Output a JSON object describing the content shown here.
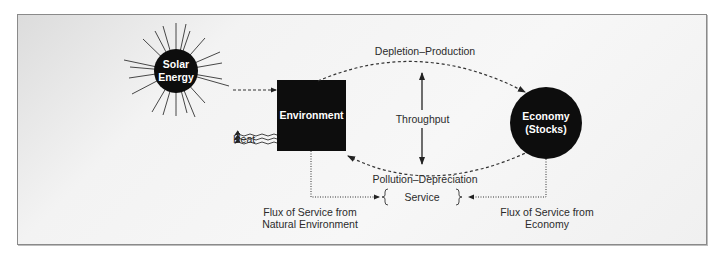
{
  "diagram": {
    "nodes": {
      "solar": {
        "line1": "Solar",
        "line2": "Energy"
      },
      "environment": {
        "label": "Environment"
      },
      "economy": {
        "line1": "Economy",
        "line2": "(Stocks)"
      },
      "service": {
        "label": "Service"
      }
    },
    "labels": {
      "heat": "Heat",
      "depletion_production": "Depletion–Production",
      "throughput": "Throughput",
      "pollution_depreciation": "Pollution–Depreciation",
      "flux_env_line1": "Flux of Service from",
      "flux_env_line2": "Natural Environment",
      "flux_econ_line1": "Flux of Service from",
      "flux_econ_line2": "Economy"
    },
    "colors": {
      "node_fill": "#0d0d0d",
      "line": "#333333",
      "text": "#2b2b2b"
    }
  }
}
